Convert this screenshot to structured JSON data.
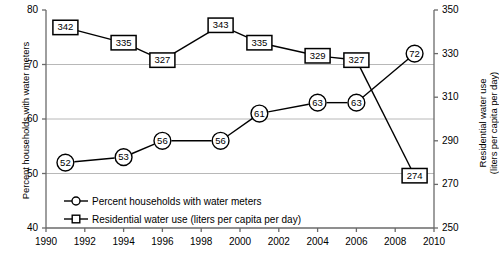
{
  "chart_data": {
    "type": "line",
    "title": "",
    "xlabel": "",
    "grid": true,
    "legend_position": "inside-lower-left",
    "x": [
      1991,
      1994,
      1996,
      1999,
      2001,
      2004,
      2006,
      2009
    ],
    "xlim": [
      1990,
      2010
    ],
    "x_ticks": [
      1990,
      1992,
      1994,
      1996,
      1998,
      2000,
      2002,
      2004,
      2006,
      2008,
      2010
    ],
    "axes": [
      {
        "id": "left",
        "ylabel": "Percent households with water meters",
        "ylim": [
          40,
          80
        ],
        "y_ticks": [
          40,
          50,
          60,
          70,
          80
        ]
      },
      {
        "id": "right",
        "ylabel": "Residential water use (liters per capita per day)",
        "ylabel_line1": "Residential water use",
        "ylabel_line2": "(liters per capita per day)",
        "ylim": [
          250,
          350
        ],
        "y_ticks": [
          250,
          270,
          290,
          310,
          330,
          350
        ]
      }
    ],
    "series": [
      {
        "name": "Percent households with water meters",
        "axis": "left",
        "marker": "circle",
        "color": "#000000",
        "values": [
          52,
          53,
          56,
          56,
          61,
          63,
          63,
          72
        ],
        "labels": [
          "52",
          "53",
          "56",
          "56",
          "61",
          "63",
          "63",
          "72"
        ]
      },
      {
        "name": "Residential water use (liters per capita per day)",
        "axis": "right",
        "marker": "square",
        "color": "#000000",
        "values": [
          342,
          335,
          327,
          343,
          335,
          329,
          327,
          274
        ],
        "labels": [
          "342",
          "335",
          "327",
          "343",
          "335",
          "329",
          "327",
          "274"
        ]
      }
    ]
  },
  "y_left_tick_labels": [
    "40",
    "50",
    "60",
    "70",
    "80"
  ],
  "y_right_tick_labels": [
    "250",
    "270",
    "290",
    "310",
    "330",
    "350"
  ],
  "x_tick_labels": [
    "1990",
    "1992",
    "1994",
    "1996",
    "1998",
    "2000",
    "2002",
    "2004",
    "2006",
    "2008",
    "2010"
  ],
  "y_left_title": "Percent households with water meters",
  "y_right_title_line1": "Residential water use",
  "y_right_title_line2": "(liters per capita per day)",
  "legend": {
    "items": [
      {
        "label": "Percent households with water meters",
        "marker": "circle"
      },
      {
        "label": "Residential water use (liters per capita per day)",
        "marker": "square"
      }
    ]
  }
}
